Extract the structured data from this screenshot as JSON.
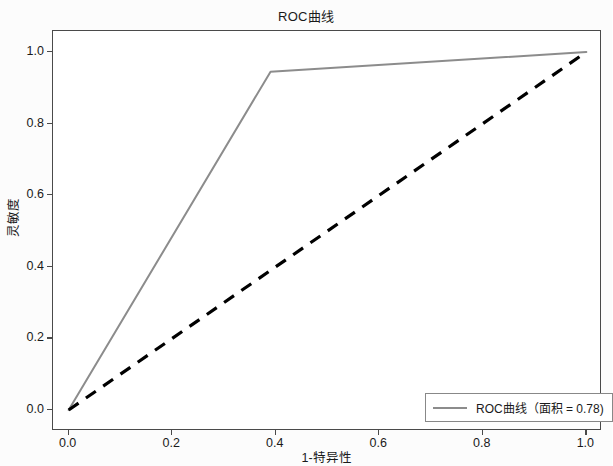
{
  "chart_data": {
    "type": "line",
    "title": "ROC曲线",
    "xlabel": "1-特异性",
    "ylabel": "灵敏度",
    "xlim": [
      0.0,
      1.0
    ],
    "ylim": [
      0.0,
      1.0
    ],
    "grid": false,
    "legend_position": "lower right",
    "xticks": [
      "0.0",
      "0.2",
      "0.4",
      "0.6",
      "0.8",
      "1.0"
    ],
    "xtick_values": [
      0.0,
      0.2,
      0.4,
      0.6,
      0.8,
      1.0
    ],
    "yticks": [
      "0.0",
      "0.2",
      "0.4",
      "0.6",
      "0.8",
      "1.0"
    ],
    "ytick_values": [
      0.0,
      0.2,
      0.4,
      0.6,
      0.8,
      1.0
    ],
    "series": [
      {
        "name": "ROC曲线（面积 = 0.78)",
        "style": "solid",
        "color": "#8c8c8c",
        "x": [
          0.0,
          0.39,
          1.0
        ],
        "y": [
          0.0,
          0.945,
          1.0
        ]
      },
      {
        "name": "chance-diagonal",
        "style": "dashed",
        "color": "#000000",
        "x": [
          0.0,
          1.0
        ],
        "y": [
          0.0,
          1.0
        ]
      }
    ],
    "auc": 0.78
  },
  "legend": {
    "entry_label": "ROC曲线（面积 = 0.78)"
  },
  "colors": {
    "roc_curve": "#8c8c8c",
    "diagonal": "#000000",
    "axis": "#4a4a4a",
    "text": "#1a1a1a"
  }
}
